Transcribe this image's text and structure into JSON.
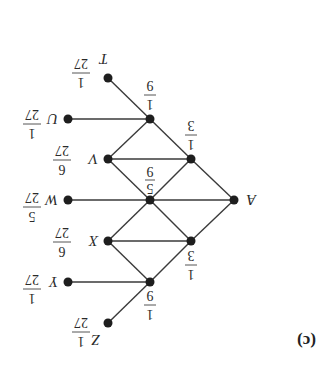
{
  "figure": {
    "panel_label": "(c)",
    "orientation": "rotated 180 degrees",
    "nodes": {
      "A": {
        "label": "A"
      },
      "T": {
        "label": "T",
        "prob_num": "1",
        "prob_den": "27"
      },
      "U": {
        "label": "U",
        "prob_num": "1",
        "prob_den": "27"
      },
      "V": {
        "label": "V",
        "prob_num": "6",
        "prob_den": "27"
      },
      "W": {
        "label": "W",
        "prob_num": "5",
        "prob_den": "27"
      },
      "X": {
        "label": "X",
        "prob_num": "6",
        "prob_den": "27"
      },
      "Y": {
        "label": "Y",
        "prob_num": "1",
        "prob_den": "27"
      },
      "Z": {
        "label": "Z",
        "prob_num": "1",
        "prob_den": "27"
      }
    },
    "internal": {
      "upper_third": {
        "num": "1",
        "den": "3"
      },
      "lower_third": {
        "num": "1",
        "den": "3"
      },
      "center": {
        "num": "5",
        "den": "9"
      },
      "top_ninth": {
        "num": "1",
        "den": "9"
      },
      "bottom_ninth": {
        "num": "1",
        "den": "9"
      }
    }
  }
}
